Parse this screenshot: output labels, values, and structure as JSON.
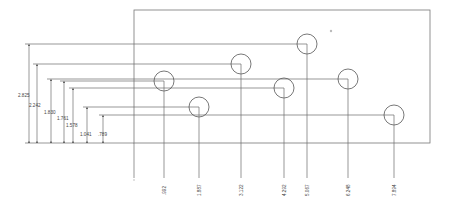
{
  "drawing": {
    "type": "ordinate-dimension-hole-layout",
    "units": "in",
    "colors": {
      "line": "#6a6a6a",
      "text": "#444444",
      "background": "#ffffff"
    }
  },
  "y_dimensions": [
    {
      "label": "2.825",
      "value": 2.825
    },
    {
      "label": "2.242",
      "value": 2.242
    },
    {
      "label": "1.830",
      "value": 1.83
    },
    {
      "label": "1.761",
      "value": 1.761
    },
    {
      "label": "1.578",
      "value": 1.578
    },
    {
      "label": "1.041",
      "value": 1.041
    },
    {
      "label": ".789",
      "value": 0.789
    }
  ],
  "x_dimensions": [
    {
      "label": ".992",
      "value": 0.992
    },
    {
      "label": "1.887",
      "value": 1.887
    },
    {
      "label": "3.122",
      "value": 3.122
    },
    {
      "label": "4.292",
      "value": 4.292
    },
    {
      "label": "5.067",
      "value": 5.067
    },
    {
      "label": "6.248",
      "value": 6.248
    },
    {
      "label": "7.894",
      "value": 7.894
    }
  ],
  "holes": [
    {
      "x": ".992",
      "y": "1.830"
    },
    {
      "x": "1.887",
      "y": "1.041"
    },
    {
      "x": "3.122",
      "y": "2.242"
    },
    {
      "x": "4.292",
      "y": "1.578"
    },
    {
      "x": "5.067",
      "y": "2.825"
    },
    {
      "x": "6.248",
      "y": "1.761"
    },
    {
      "x": "7.894",
      "y": ".789"
    }
  ]
}
